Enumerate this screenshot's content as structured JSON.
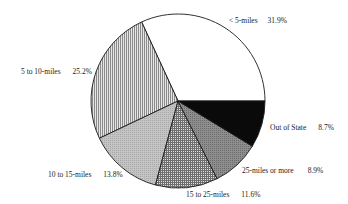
{
  "chart_data": {
    "type": "pie",
    "title": "",
    "start_angle_deg": 0,
    "direction": "counterclockwise",
    "slices": [
      {
        "label": "< 5-miles",
        "value": 31.9,
        "pct_label": "31.9%",
        "fill": "white"
      },
      {
        "label": "5 to 10-miles",
        "value": 25.2,
        "pct_label": "25.2%",
        "fill": "vertical-lines"
      },
      {
        "label": "10 to 15-miles",
        "value": 13.8,
        "pct_label": "13.8%",
        "fill": "light-gray-dots"
      },
      {
        "label": "15 to 25-miles",
        "value": 11.6,
        "pct_label": "11.6%",
        "fill": "crosshatch"
      },
      {
        "label": "25-miles or more",
        "value": 8.9,
        "pct_label": "8.9%",
        "fill": "dark-gray"
      },
      {
        "label": "Out of State",
        "value": 8.7,
        "pct_label": "8.7%",
        "fill": "black"
      }
    ],
    "categories": [
      "< 5-miles",
      "5 to 10-miles",
      "10 to 15-miles",
      "15 to 25-miles",
      "25-miles or more",
      "Out of State"
    ],
    "values": [
      31.9,
      25.2,
      13.8,
      11.6,
      8.9,
      8.7
    ],
    "legend": "inline labels"
  },
  "labels": {
    "s0": {
      "name": "< 5-miles",
      "pct": "31.9%"
    },
    "s1": {
      "name": "5 to 10-miles",
      "pct": "25.2%"
    },
    "s2": {
      "name": "10 to 15-miles",
      "pct": "13.8%"
    },
    "s3": {
      "name": "15 to 25-miles",
      "pct": "11.6%"
    },
    "s4": {
      "name": "25-miles or more",
      "pct": "8.9%"
    },
    "s5": {
      "name": "Out of State",
      "pct": "8.7%"
    }
  },
  "colors": {
    "outline": "#1a1a1a",
    "white": "#ffffff",
    "vlines_bg": "#e6e6e6",
    "vlines_fg": "#8a8a8a",
    "lightgray": "#bdbdbd",
    "crosshatch_bg": "#e0e0e0",
    "crosshatch_fg": "#6e6e6e",
    "darkgray": "#8c8c8c",
    "black": "#0a0a0a"
  }
}
